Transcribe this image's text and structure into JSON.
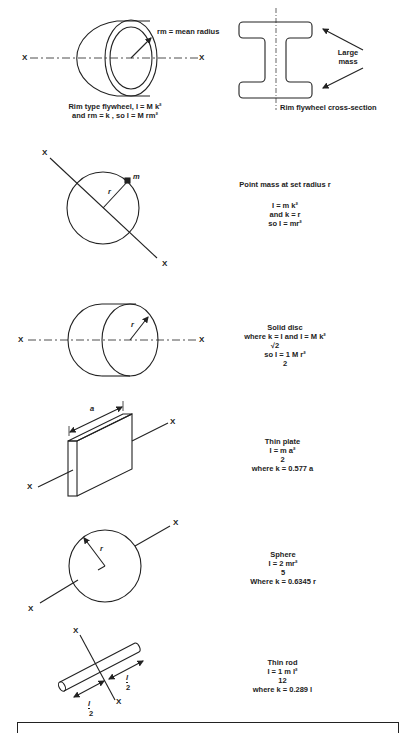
{
  "figures": [
    {
      "id": "rim-flywheel",
      "caption_line1": "Rim type flywheel,  I = M k²",
      "caption_line2": "and rm = k , so  I = M rm²",
      "radius_label": "rm = mean radius",
      "axis_left": "X",
      "axis_right": "X"
    },
    {
      "id": "rim-cross-section",
      "annotation": "Large mass",
      "caption": "Rim flywheel cross-section"
    },
    {
      "id": "point-mass",
      "title": "Point mass at set radius r",
      "formula_line1": "I = m k²",
      "formula_line2": "and k = r",
      "formula_line3": "so I = mr²",
      "mass_label": "m",
      "radius_label": "r",
      "axis_top": "X",
      "axis_bottom": "X"
    },
    {
      "id": "solid-disc",
      "title": "Solid disc",
      "formula_line1": "where  k =  I   and  I = M k²",
      "formula_line1_denominator": "√2",
      "formula_line2": "so  I = 1 M r²",
      "formula_line2_denominator": "2",
      "radius_label": "r",
      "axis_left": "X",
      "axis_right": "X"
    },
    {
      "id": "thin-plate",
      "title": "Thin plate",
      "formula_numerator": "I = m a²",
      "formula_denominator": "2",
      "formula_k": "where k = 0.577 a",
      "dimension_label": "a",
      "axis_left": "X",
      "axis_right": "X"
    },
    {
      "id": "sphere",
      "title": "Sphere",
      "formula_numerator": "I = 2  mr²",
      "formula_denominator": "5",
      "formula_k": "Where k = 0.6345 r",
      "radius_label": "r",
      "axis_left": "X",
      "axis_right": "X"
    },
    {
      "id": "thin-rod",
      "title": "Thin rod",
      "formula_numerator": "I = 1 m l²",
      "formula_denominator": "12",
      "formula_k": "where k = 0.289 l",
      "half_length_num": "l",
      "half_length_den": "2",
      "axis_top": "X",
      "axis_bottom": "X"
    }
  ]
}
